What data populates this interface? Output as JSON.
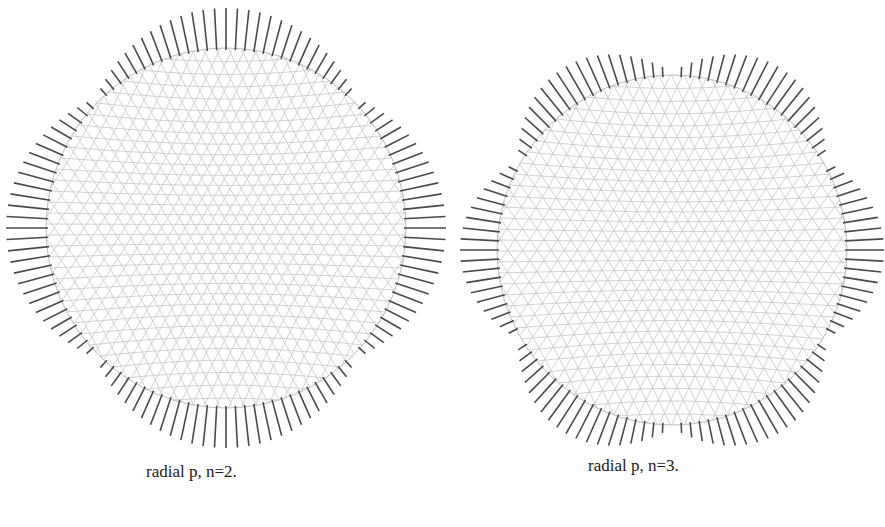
{
  "figure": {
    "panels": [
      {
        "id": "left",
        "caption": "radial p, n=2.",
        "mode_number": 2,
        "center": [
          226,
          228
        ],
        "radius": 180,
        "spike_count": 120,
        "spike_base_length": 4,
        "spike_amplitude": 36,
        "phase_deg": 90,
        "mesh_color": "#c8c8c8",
        "spike_color": "#4a4a4a"
      },
      {
        "id": "right",
        "caption": "radial p, n=3.",
        "mode_number": 3,
        "center": [
          672,
          250
        ],
        "radius": 175,
        "spike_count": 120,
        "spike_base_length": 3,
        "spike_amplitude": 34,
        "phase_deg": 0,
        "mesh_color": "#c8c8c8",
        "spike_color": "#4a4a4a"
      }
    ]
  }
}
